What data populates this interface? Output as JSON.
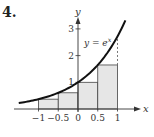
{
  "problem_number": "4.",
  "chart_data": {
    "type": "area",
    "title": "",
    "function_label": "y = e^x",
    "function_label_parts": {
      "base": "y = e",
      "exp": "x"
    },
    "xlabel": "x",
    "ylabel": "y",
    "x_ticks": [
      "−1",
      "−0.5",
      "0",
      "0.5",
      "1"
    ],
    "x_tick_values": [
      -1,
      -0.5,
      0,
      0.5,
      1
    ],
    "y_ticks": [
      "1",
      "2",
      "3"
    ],
    "y_tick_values": [
      1,
      2,
      3
    ],
    "xlim": [
      -1.5,
      1.35
    ],
    "ylim": [
      0,
      3.3
    ],
    "grid": false,
    "curve": {
      "expression": "e^x",
      "x_range": [
        -1.5,
        1.2
      ]
    },
    "rectangles": [
      {
        "x_left": -1,
        "x_right": -0.5,
        "height": 0.368
      },
      {
        "x_left": -0.5,
        "x_right": 0,
        "height": 0.607
      },
      {
        "x_left": 0,
        "x_right": 0.5,
        "height": 1.0
      },
      {
        "x_left": 0.5,
        "x_right": 1,
        "height": 1.649
      }
    ],
    "dashed_line": {
      "x": 1,
      "from_y": 1.649,
      "to_y": 2.718
    },
    "rect_fill": "#e6e6e6",
    "stroke": "#222222"
  }
}
